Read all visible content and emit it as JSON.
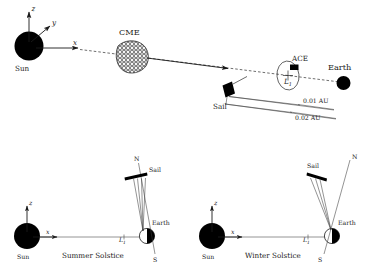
{
  "figure": {
    "background_color": "#ffffff",
    "ink_color": "#000000"
  },
  "top_panel": {
    "name": "sun-cme-l1-earth-overview",
    "sun": {
      "label": "Sun",
      "color": "#000000"
    },
    "axes": {
      "z_label": "z",
      "y_label": "y",
      "x_label": "x"
    },
    "cme": {
      "label": "CME",
      "texture": "hatched-mesh-blob"
    },
    "sail": {
      "label": "Sail",
      "color": "#000000"
    },
    "ace": {
      "label": "ACE",
      "orbit": "halo-orbit-ellipse"
    },
    "lagrange_point": {
      "label": "L",
      "subscript": "1"
    },
    "earth": {
      "label": "Earth",
      "color": "#000000"
    },
    "distance_markers": [
      {
        "label": "0.01 AU"
      },
      {
        "label": "0.02 AU"
      }
    ]
  },
  "bottom_left_panel": {
    "name": "summer-solstice-panel",
    "caption": "Summer Solstice",
    "sun": {
      "label": "Sun"
    },
    "axes": {
      "z_label": "z",
      "x_label": "x"
    },
    "lagrange_point": {
      "label": "L",
      "subscript": "1"
    },
    "earth": {
      "label": "Earth"
    },
    "pole_north": {
      "label": "N"
    },
    "pole_south": {
      "label": "S"
    },
    "sail": {
      "label": "Sail"
    }
  },
  "bottom_right_panel": {
    "name": "winter-solstice-panel",
    "caption": "Winter Solstice",
    "sun": {
      "label": "Sun"
    },
    "axes": {
      "z_label": "z",
      "x_label": "x"
    },
    "lagrange_point": {
      "label": "L",
      "subscript": "1"
    },
    "earth": {
      "label": "Earth"
    },
    "pole_north": {
      "label": "N"
    },
    "pole_south": {
      "label": "S"
    },
    "sail": {
      "label": "Sail"
    }
  }
}
